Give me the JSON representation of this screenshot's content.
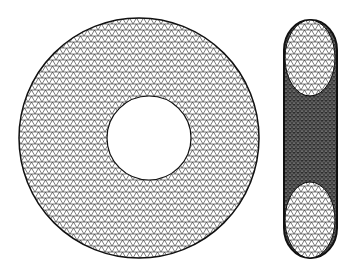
{
  "figure": {
    "views": [
      {
        "id": "top",
        "label": "Top view",
        "center": [
          139,
          138
        ],
        "outer_radius": 120,
        "hole_center": [
          149,
          138
        ],
        "hole_radius": 42
      },
      {
        "id": "side",
        "label": "Side view",
        "x": [
          284,
          337
        ],
        "y": [
          20,
          258
        ]
      }
    ],
    "colors": {
      "background": "#ffffff",
      "mesh_line": "#111111",
      "fill": "#cfcfcf"
    }
  }
}
